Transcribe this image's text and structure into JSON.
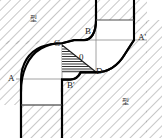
{
  "figure": {
    "type": "engineering-cross-section",
    "canvas": {
      "width": 162,
      "height": 138
    },
    "background_color": "#ffffff",
    "outline_color": "#000000",
    "thin_line_color": "#808080",
    "hatch_color": "#9a9a9a",
    "triangle_hatch_color": "#1a1a1a"
  },
  "labels": {
    "point_a": {
      "text": "A",
      "x": 8,
      "y": 79
    },
    "point_a_prime": {
      "text": "A'",
      "x": 139,
      "y": 38
    },
    "point_b": {
      "text": "B",
      "x": 85,
      "y": 32
    },
    "point_b_prime": {
      "text": "B'",
      "x": 68,
      "y": 86
    },
    "point_c": {
      "text": "C",
      "x": 55,
      "y": 44
    },
    "point_d": {
      "text": "D",
      "x": 96,
      "y": 72
    },
    "origin": {
      "text": "0",
      "x": 80,
      "y": 57
    },
    "die_upper": {
      "text": "型",
      "x": 31,
      "y": 20
    },
    "die_lower": {
      "text": "型",
      "x": 123,
      "y": 103
    }
  },
  "geometry": {
    "upper_die_hatch_region": "top-left block plus top-right outer band",
    "lower_die_hatch_region": "bottom-right block plus bottom-left outer band",
    "neutral_triangle": {
      "vertices": "C(62,47) - D(96,72) - (62,72)",
      "hatch": "horizontal lines"
    },
    "s_curve": "A(22,79) up-right through C(62,47) to B(84,40) then down-right through D(96,72) to A'(134,40)",
    "thin_guides": [
      "horizontal line at y=40 from x=84 to x=146",
      "horizontal line at y=79 from x=16 to x=62",
      "horizontal line at y=72 from x=62 to x=96",
      "horizontal line at y=105 from x=22 to x=62",
      "horizontal line at y=21 from x=96 to x=134",
      "vertical line at x=62 from y=47 to y=105",
      "vertical line at x=96 from y=21 to y=72"
    ]
  }
}
